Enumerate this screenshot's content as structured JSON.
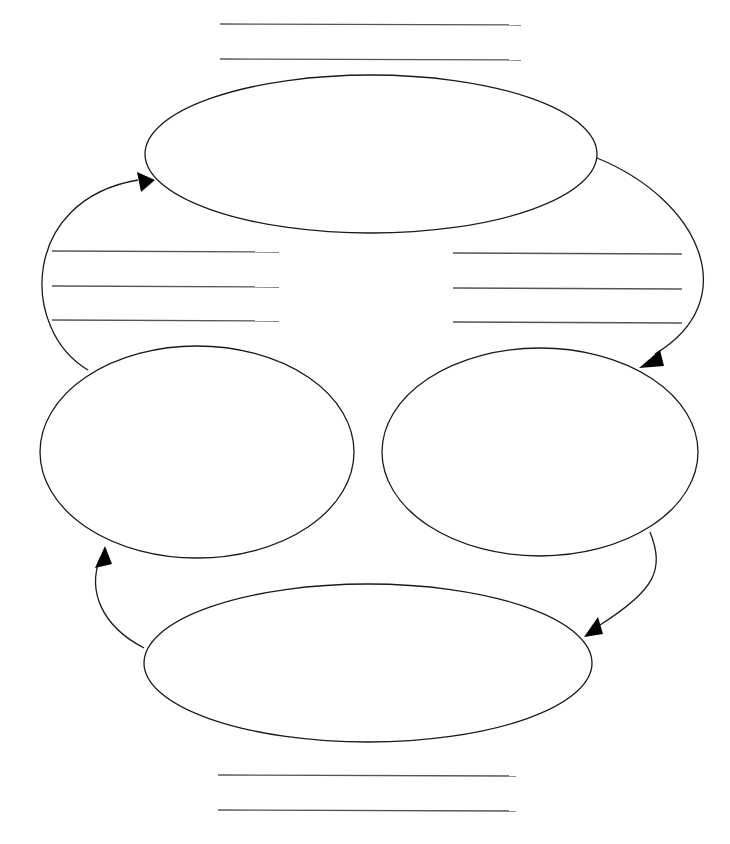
{
  "diagram": {
    "type": "cycle-worksheet",
    "colors": {
      "stroke": "#1a1a1a",
      "line": "#555555",
      "background": "#ffffff"
    },
    "nodes": [
      {
        "id": "top",
        "cx": 371,
        "cy": 154,
        "rx": 226,
        "ry": 79,
        "label": ""
      },
      {
        "id": "left",
        "cx": 197,
        "cy": 452,
        "rx": 157,
        "ry": 106,
        "label": ""
      },
      {
        "id": "right",
        "cx": 540,
        "cy": 452,
        "rx": 158,
        "ry": 104,
        "label": ""
      },
      {
        "id": "bottom",
        "cx": 368,
        "cy": 663,
        "rx": 224,
        "ry": 79,
        "label": ""
      }
    ],
    "writing_line_groups": [
      {
        "id": "title-lines",
        "x1": 220,
        "x2": 521,
        "ys": [
          24,
          59
        ]
      },
      {
        "id": "left-lines",
        "x1": 52,
        "x2": 279,
        "ys": [
          251,
          286,
          320
        ]
      },
      {
        "id": "right-lines",
        "x1": 453,
        "x2": 682,
        "ys": [
          253,
          288,
          322
        ]
      },
      {
        "id": "footer-lines",
        "x1": 218,
        "x2": 516,
        "ys": [
          775,
          810
        ]
      }
    ],
    "arrows": [
      {
        "id": "top-to-right",
        "d": "M597,158 C700,200 745,300 655,354",
        "head": "639,368 660,350 664,366"
      },
      {
        "id": "right-to-bottom",
        "d": "M650,532 C665,570 655,590 600,625",
        "head": "584,637 598,617 603,634"
      },
      {
        "id": "bottom-to-left",
        "d": "M144,648 C100,625 88,590 100,558",
        "head": "105,546 95,568 112,564"
      },
      {
        "id": "left-to-top",
        "d": "M88,370 C20,330 20,200 138,180",
        "head": "155,180 137,172 141,192"
      }
    ]
  }
}
